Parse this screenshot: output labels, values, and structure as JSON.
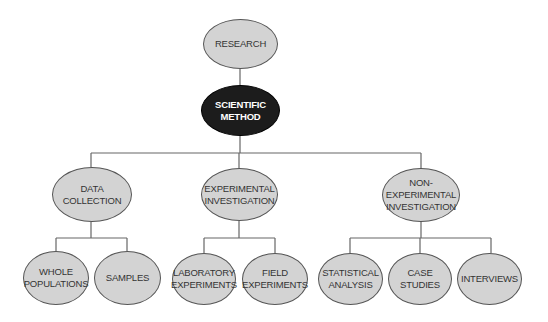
{
  "diagram": {
    "colors": {
      "node_fill": "#d3d3d3",
      "node_border": "#555555",
      "root_child_fill": "#1c1c1c",
      "line": "#666666",
      "text": "#333333"
    },
    "nodes": [
      {
        "id": "research",
        "label": "RESEARCH",
        "x": 203,
        "y": 19,
        "w": 75,
        "h": 50
      },
      {
        "id": "scientific_method",
        "label": "SCIENTIFIC\nMETHOD",
        "x": 201,
        "y": 85,
        "w": 79,
        "h": 51,
        "dark": true
      },
      {
        "id": "data_collection",
        "label": "DATA\nCOLLECTION",
        "x": 52,
        "y": 167,
        "w": 80,
        "h": 55
      },
      {
        "id": "experimental_investigation",
        "label": "EXPERIMENTAL\nINVESTIGATION",
        "x": 201,
        "y": 168,
        "w": 77,
        "h": 53
      },
      {
        "id": "non_experimental_investigation",
        "label": "NON-\nEXPERIMENTAL\nINVESTIGATION",
        "x": 382,
        "y": 168,
        "w": 78,
        "h": 54
      },
      {
        "id": "whole_populations",
        "label": "WHOLE\nPOPULATIONS",
        "x": 23,
        "y": 251,
        "w": 66,
        "h": 54
      },
      {
        "id": "samples",
        "label": "SAMPLES",
        "x": 94,
        "y": 251,
        "w": 67,
        "h": 54
      },
      {
        "id": "laboratory_experiments",
        "label": "LABORATORY\nEXPERIMENTS",
        "x": 172,
        "y": 253,
        "w": 64,
        "h": 52
      },
      {
        "id": "field_experiments",
        "label": "FIELD\nEXPERIMENTS",
        "x": 242,
        "y": 253,
        "w": 66,
        "h": 52
      },
      {
        "id": "statistical_analysis",
        "label": "STATISTICAL\nANALYSIS",
        "x": 318,
        "y": 253,
        "w": 65,
        "h": 52
      },
      {
        "id": "case_studies",
        "label": "CASE\nSTUDIES",
        "x": 388,
        "y": 253,
        "w": 64,
        "h": 52
      },
      {
        "id": "interviews",
        "label": "INTERVIEWS",
        "x": 457,
        "y": 253,
        "w": 65,
        "h": 52
      }
    ],
    "edges": [
      {
        "from": "research",
        "to": "scientific_method"
      },
      {
        "from": "scientific_method",
        "to": "data_collection"
      },
      {
        "from": "scientific_method",
        "to": "experimental_investigation"
      },
      {
        "from": "scientific_method",
        "to": "non_experimental_investigation"
      },
      {
        "from": "data_collection",
        "to": "whole_populations"
      },
      {
        "from": "data_collection",
        "to": "samples"
      },
      {
        "from": "experimental_investigation",
        "to": "laboratory_experiments"
      },
      {
        "from": "experimental_investigation",
        "to": "field_experiments"
      },
      {
        "from": "non_experimental_investigation",
        "to": "statistical_analysis"
      },
      {
        "from": "non_experimental_investigation",
        "to": "case_studies"
      },
      {
        "from": "non_experimental_investigation",
        "to": "interviews"
      }
    ],
    "connector_lines": [
      {
        "x1": 240,
        "y1": 69,
        "x2": 240,
        "y2": 85
      },
      {
        "x1": 240,
        "y1": 136,
        "x2": 240,
        "y2": 153
      },
      {
        "x1": 91,
        "y1": 153,
        "x2": 421,
        "y2": 153
      },
      {
        "x1": 91,
        "y1": 153,
        "x2": 91,
        "y2": 167
      },
      {
        "x1": 239,
        "y1": 153,
        "x2": 239,
        "y2": 168
      },
      {
        "x1": 421,
        "y1": 153,
        "x2": 421,
        "y2": 168
      },
      {
        "x1": 91,
        "y1": 222,
        "x2": 91,
        "y2": 238
      },
      {
        "x1": 56,
        "y1": 238,
        "x2": 127,
        "y2": 238
      },
      {
        "x1": 56,
        "y1": 238,
        "x2": 56,
        "y2": 251
      },
      {
        "x1": 127,
        "y1": 238,
        "x2": 127,
        "y2": 251
      },
      {
        "x1": 239,
        "y1": 221,
        "x2": 239,
        "y2": 238
      },
      {
        "x1": 204,
        "y1": 238,
        "x2": 275,
        "y2": 238
      },
      {
        "x1": 204,
        "y1": 238,
        "x2": 204,
        "y2": 253
      },
      {
        "x1": 275,
        "y1": 238,
        "x2": 275,
        "y2": 253
      },
      {
        "x1": 421,
        "y1": 222,
        "x2": 421,
        "y2": 238
      },
      {
        "x1": 350,
        "y1": 238,
        "x2": 491,
        "y2": 238
      },
      {
        "x1": 350,
        "y1": 238,
        "x2": 350,
        "y2": 253
      },
      {
        "x1": 420,
        "y1": 238,
        "x2": 420,
        "y2": 253
      },
      {
        "x1": 491,
        "y1": 238,
        "x2": 491,
        "y2": 253
      }
    ]
  }
}
